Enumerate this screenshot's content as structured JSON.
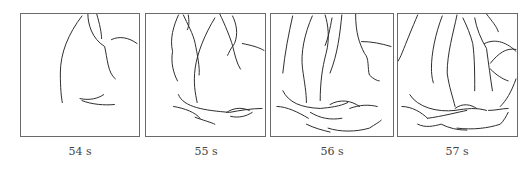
{
  "figure": {
    "panels": [
      {
        "label": "54 s"
      },
      {
        "label": "55 s"
      },
      {
        "label": "56 s"
      },
      {
        "label": "57 s"
      }
    ]
  }
}
